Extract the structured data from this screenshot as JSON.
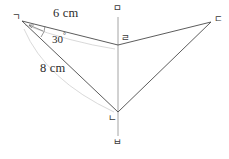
{
  "figure": {
    "type": "geometry-diagram",
    "canvas": {
      "width": 229,
      "height": 159
    },
    "colors": {
      "stroke": "#4a4a4a",
      "axis": "#8a8a8a",
      "arc": "#c9c9c9",
      "text": "#2b2b2b",
      "label": "#3a3a3a",
      "background": "#ffffff"
    },
    "vertices": [
      {
        "id": "g",
        "label": "ㄱ",
        "x": 22,
        "y": 21,
        "label_x": 12,
        "label_y": 12
      },
      {
        "id": "d",
        "label": "ㄷ",
        "x": 211,
        "y": 22,
        "label_x": 214,
        "label_y": 14
      },
      {
        "id": "n",
        "label": "ㄴ",
        "x": 118,
        "y": 112,
        "label_x": 108,
        "label_y": 113
      },
      {
        "id": "r",
        "label": "ㄹ",
        "x": 118,
        "y": 45,
        "label_x": 121,
        "label_y": 33
      },
      {
        "id": "m",
        "label": "ㅁ",
        "x": 118,
        "y": 12,
        "label_x": 113,
        "label_y": 4
      },
      {
        "id": "b",
        "label": "ㅂ",
        "x": 118,
        "y": 142,
        "label_x": 113,
        "label_y": 137
      }
    ],
    "segments": [
      {
        "name": "g-to-r",
        "from": "g",
        "to": "r"
      },
      {
        "name": "r-to-d",
        "from": "r",
        "to": "d"
      },
      {
        "name": "g-to-n",
        "from": "g",
        "to": "n"
      },
      {
        "name": "n-to-d",
        "from": "n",
        "to": "d"
      }
    ],
    "axis": {
      "name": "vertical-axis-mb",
      "x": 118,
      "y_top": 17,
      "y_bottom": 136
    },
    "measure_arcs": [
      {
        "name": "arc-6cm",
        "d": "M 25 25 Q 70 42 115 49"
      },
      {
        "name": "arc-8cm",
        "d": "M 24 28 Q 48 78 114 113"
      }
    ],
    "angle_mark": {
      "name": "angle-30-arc",
      "d": "M 44 25 Q 44 31 41 36",
      "arrow_tip_x": 30,
      "arrow_tip_y": 26
    },
    "labels": {
      "side_top": {
        "text": "6 cm",
        "x": 53,
        "y": 12
      },
      "side_left": {
        "text": "8 cm",
        "x": 40,
        "y": 66
      },
      "angle": {
        "number": "30",
        "degree": "°",
        "x": 52,
        "y": 32
      }
    }
  }
}
